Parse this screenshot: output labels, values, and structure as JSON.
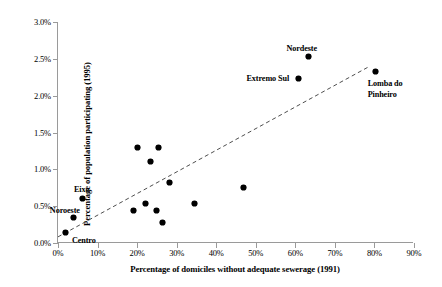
{
  "chart_data": {
    "type": "scatter",
    "title": "",
    "xlabel": "Percentage of domiciles without adequate sewerage (1991)",
    "ylabel": "Percentage of population participating (1995)",
    "xlim": [
      0,
      90
    ],
    "ylim": [
      0,
      3.0
    ],
    "xticks": [
      "0%",
      "10%",
      "20%",
      "30%",
      "40%",
      "50%",
      "60%",
      "70%",
      "80%",
      "90%"
    ],
    "xtick_values": [
      0,
      10,
      20,
      30,
      40,
      50,
      60,
      70,
      80,
      90
    ],
    "yticks": [
      "0.0%",
      "0.5%",
      "1.0%",
      "1.5%",
      "2.0%",
      "2.5%",
      "3.0%"
    ],
    "ytick_values": [
      0.0,
      0.5,
      1.0,
      1.5,
      2.0,
      2.5,
      3.0
    ],
    "grid": false,
    "legend": "none",
    "marker": "filled-diamond",
    "marker_color": "#000000",
    "points": [
      {
        "label": "Centro",
        "x": 2.0,
        "y": 0.14
      },
      {
        "label": "Noroeste",
        "x": 4.0,
        "y": 0.34
      },
      {
        "label": "Eixo",
        "x": 6.3,
        "y": 0.61
      },
      {
        "label": "",
        "x": 19.0,
        "y": 0.44
      },
      {
        "label": "",
        "x": 20.0,
        "y": 1.3
      },
      {
        "label": "",
        "x": 22.0,
        "y": 0.53
      },
      {
        "label": "",
        "x": 23.3,
        "y": 1.11
      },
      {
        "label": "",
        "x": 25.0,
        "y": 0.44
      },
      {
        "label": "",
        "x": 25.3,
        "y": 1.3
      },
      {
        "label": "",
        "x": 26.5,
        "y": 0.28
      },
      {
        "label": "",
        "x": 28.3,
        "y": 0.82
      },
      {
        "label": "",
        "x": 34.5,
        "y": 0.53
      },
      {
        "label": "",
        "x": 46.8,
        "y": 0.75
      },
      {
        "label": "Extremo Sul",
        "x": 60.8,
        "y": 2.23
      },
      {
        "label": "Nordeste",
        "x": 63.3,
        "y": 2.53
      },
      {
        "label": "Lomba do Pinheiro",
        "x": 80.3,
        "y": 2.33
      }
    ],
    "trendline": {
      "style": "dashed",
      "color": "#4d4d4d",
      "x_start": 0.0,
      "y_start": 0.07,
      "x_end": 78.8,
      "y_end": 2.39
    }
  },
  "point_labels": [
    {
      "text": "Eixo",
      "anchor_x": 6.3,
      "anchor_y": 0.61,
      "dx": -9,
      "dy": -13
    },
    {
      "text": "Noroeste",
      "anchor_x": 4.0,
      "anchor_y": 0.34,
      "dx": -24,
      "dy": -12
    },
    {
      "text": "Centro",
      "anchor_x": 2.0,
      "anchor_y": 0.14,
      "dx": 6,
      "dy": 3
    },
    {
      "text": "Extremo Sul",
      "anchor_x": 60.8,
      "anchor_y": 2.23,
      "dx": -52,
      "dy": -5
    },
    {
      "text": "Nordeste",
      "anchor_x": 63.3,
      "anchor_y": 2.53,
      "dx": -22,
      "dy": -13
    },
    {
      "text": "Lomba do",
      "anchor_x": 80.3,
      "anchor_y": 2.33,
      "dx": -8,
      "dy": 8
    },
    {
      "text": "Pinheiro",
      "anchor_x": 80.3,
      "anchor_y": 2.33,
      "dx": -8,
      "dy": 19
    }
  ]
}
